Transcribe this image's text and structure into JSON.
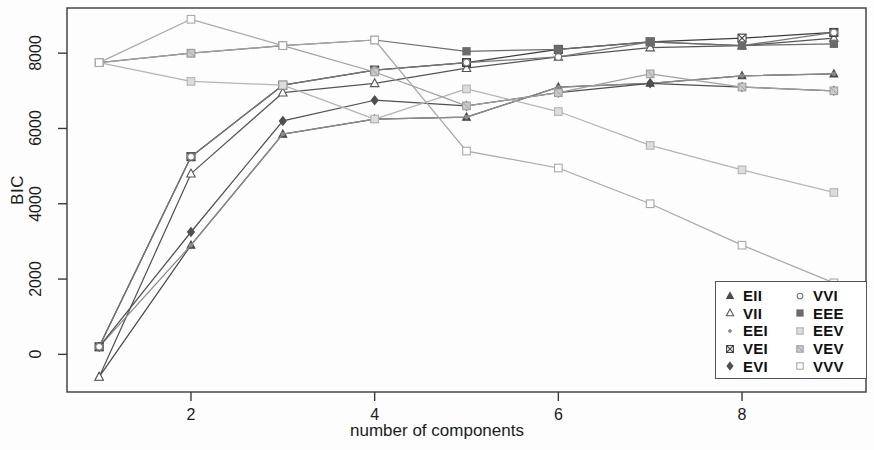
{
  "chart_data": {
    "type": "line",
    "title": "",
    "subtitle": "",
    "xlabel": "number of components",
    "ylabel": "BIC",
    "x": [
      1,
      2,
      3,
      4,
      5,
      6,
      7,
      8,
      9
    ],
    "xticks": [
      "2",
      "4",
      "6",
      "8"
    ],
    "xtick_values": [
      2,
      4,
      6,
      8
    ],
    "yticks": [
      "0",
      "2000",
      "4000",
      "6000",
      "8000"
    ],
    "ytick_values": [
      0,
      2000,
      4000,
      6000,
      8000
    ],
    "xlim": [
      0.65,
      9.35
    ],
    "ylim": [
      -1000,
      9200
    ],
    "grid": false,
    "legend_position": "bottom-right",
    "series": [
      {
        "name": "EII",
        "marker": "filled-triangle-up",
        "color": "#4a4a4a",
        "values": [
          -600,
          2900,
          5850,
          6250,
          6300,
          7100,
          7200,
          7400,
          7450
        ]
      },
      {
        "name": "VII",
        "marker": "open-triangle-up",
        "color": "#555555",
        "values": [
          -600,
          4800,
          6950,
          7200,
          7600,
          7900,
          8150,
          8200,
          8400
        ]
      },
      {
        "name": "EEI",
        "marker": "small-dot",
        "color": "#8c8c8c",
        "values": [
          200,
          2900,
          5850,
          6250,
          6300,
          7100,
          7200,
          7400,
          7450
        ]
      },
      {
        "name": "VEI",
        "marker": "crossed-square",
        "color": "#3c3c3c",
        "values": [
          200,
          5250,
          7150,
          7550,
          7750,
          8100,
          8300,
          8400,
          8550
        ]
      },
      {
        "name": "EVI",
        "marker": "filled-diamond",
        "color": "#4f4f4f",
        "values": [
          200,
          3250,
          6200,
          6750,
          6600,
          6950,
          7200,
          7100,
          7000
        ]
      },
      {
        "name": "VVI",
        "marker": "open-circle",
        "color": "#767676",
        "values": [
          200,
          5250,
          7150,
          7550,
          7750,
          7900,
          8300,
          8200,
          8550
        ]
      },
      {
        "name": "EEE",
        "marker": "filled-square",
        "color": "#6b6b6b",
        "values": [
          7750,
          8000,
          8200,
          8350,
          8050,
          8100,
          8300,
          8200,
          8250
        ]
      },
      {
        "name": "EEV",
        "marker": "light-square",
        "color": "#b4b4b4",
        "values": [
          7750,
          7250,
          7150,
          6250,
          7050,
          6450,
          5550,
          4900,
          4300
        ]
      },
      {
        "name": "VEV",
        "marker": "shaded-square",
        "color": "#a0a0a0",
        "values": [
          7750,
          8000,
          8200,
          7500,
          6600,
          6950,
          7450,
          7100,
          7000
        ]
      },
      {
        "name": "VVV",
        "marker": "open-square",
        "color": "#a8a8a8",
        "values": [
          7750,
          8900,
          8200,
          8350,
          5400,
          4950,
          4000,
          2900,
          1900
        ]
      }
    ]
  },
  "legend": {
    "entries": [
      {
        "label": "EII",
        "marker": "filled-triangle-up",
        "color": "#4a4a4a"
      },
      {
        "label": "VVI",
        "marker": "open-circle",
        "color": "#767676"
      },
      {
        "label": "VII",
        "marker": "open-triangle-up",
        "color": "#555555"
      },
      {
        "label": "EEE",
        "marker": "filled-square",
        "color": "#6b6b6b"
      },
      {
        "label": "EEI",
        "marker": "small-dot",
        "color": "#8c8c8c"
      },
      {
        "label": "EEV",
        "marker": "light-square",
        "color": "#b4b4b4"
      },
      {
        "label": "VEI",
        "marker": "crossed-square",
        "color": "#3c3c3c"
      },
      {
        "label": "VEV",
        "marker": "shaded-square",
        "color": "#a0a0a0"
      },
      {
        "label": "EVI",
        "marker": "filled-diamond",
        "color": "#4f4f4f"
      },
      {
        "label": "VVV",
        "marker": "open-square",
        "color": "#a8a8a8"
      }
    ]
  }
}
